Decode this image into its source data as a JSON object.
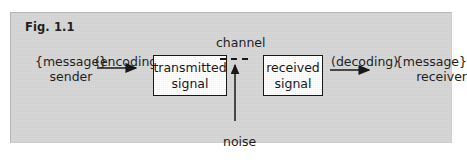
{
  "figure": {
    "label": "Fig. 1.1",
    "background_color": "#d7d7d7",
    "ink_color": "#141414"
  },
  "diagram": {
    "type": "communication-model",
    "sender": {
      "message_tag": "{message}",
      "role": "sender"
    },
    "receiver": {
      "message_tag": "{message}",
      "role": "receiver"
    },
    "encoding_label": "(encoding)",
    "decoding_label": "(decoding)",
    "channel_label": "channel",
    "noise_label": "noise",
    "boxes": [
      {
        "line1": "transmitted",
        "line2": "signal"
      },
      {
        "line1": "received",
        "line2": "signal"
      }
    ],
    "connectors": [
      {
        "name": "encoding-arrow",
        "style": "solid-arrow",
        "direction": "right"
      },
      {
        "name": "channel-link",
        "style": "dashed",
        "direction": "right"
      },
      {
        "name": "noise-arrow",
        "style": "solid-arrow",
        "direction": "up"
      },
      {
        "name": "decoding-arrow",
        "style": "solid-arrow",
        "direction": "right"
      }
    ]
  }
}
